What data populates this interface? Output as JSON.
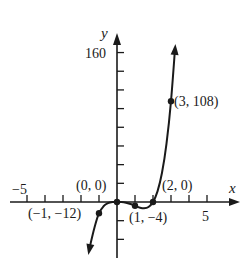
{
  "chart_data": {
    "type": "line",
    "title": "",
    "xlabel": "x",
    "ylabel": "y",
    "xlim": [
      -5.9,
      6.7
    ],
    "ylim": [
      -60,
      180
    ],
    "grid": false,
    "x_tick_step": 1,
    "y_tick_step": 20,
    "x_tick_labels": [
      {
        "value": -5,
        "label": "−5"
      },
      {
        "value": 5,
        "label": "5"
      }
    ],
    "y_tick_labels": [
      {
        "value": 160,
        "label": "160"
      }
    ],
    "series": [
      {
        "name": "curve",
        "x": [
          -1.55,
          -1.5,
          -1.25,
          -1.0,
          -0.75,
          -0.5,
          -0.25,
          0,
          0.25,
          0.5,
          0.75,
          1.0,
          1.25,
          1.5,
          1.75,
          2.0,
          2.25,
          2.5,
          2.75,
          3.0,
          3.23
        ],
        "y": [
          -52.4,
          -47.25,
          -27.3,
          -12.0,
          -4.64,
          -1.25,
          -0.14,
          0,
          -0.11,
          -0.75,
          -2.11,
          -4.0,
          -5.86,
          -6.75,
          -5.36,
          0,
          11.4,
          31.25,
          62.4,
          108.0,
          165.0
        ]
      }
    ],
    "points": [
      {
        "x": -1,
        "y": -12,
        "label": "(−1, −12)"
      },
      {
        "x": 0,
        "y": 0,
        "label": "(0, 0)"
      },
      {
        "x": 1,
        "y": -4,
        "label": "(1, −4)"
      },
      {
        "x": 2,
        "y": 0,
        "label": "(2, 0)"
      },
      {
        "x": 3,
        "y": 108,
        "label": "(3, 108)"
      }
    ]
  },
  "labels": {
    "x_axis": "x",
    "y_axis": "y",
    "tick_neg5": "−5",
    "tick_5": "5",
    "tick_160": "160",
    "p_neg1": "(−1, −12)",
    "p_0": "(0, 0)",
    "p_1": "(1, −4)",
    "p_2": "(2, 0)",
    "p_3": "(3, 108)"
  }
}
